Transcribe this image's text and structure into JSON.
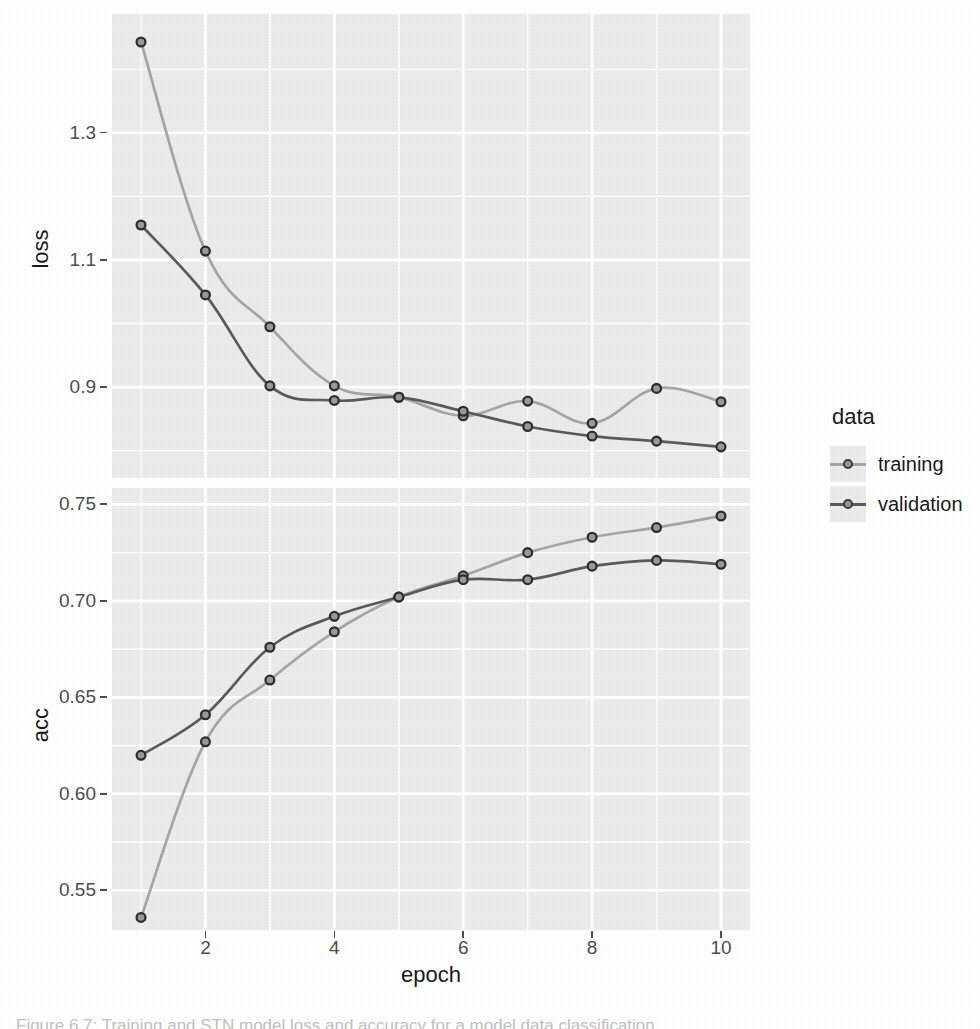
{
  "figure": {
    "caption": "Figure 6.7: Training and STN model loss and accuracy for a model data classification",
    "background_color": "#ffffff",
    "panel_background_color": "#ebebeb",
    "gridline_color": "#ffffff"
  },
  "legend": {
    "title": "data",
    "position": "right",
    "entries": [
      {
        "label": "training",
        "color": "#a5a5a5",
        "point_color": "#3a3a3a",
        "icon": "line-point-key-icon"
      },
      {
        "label": "validation",
        "color": "#5a5a5a",
        "point_color": "#3a3a3a",
        "icon": "line-point-key-icon"
      }
    ]
  },
  "axes": {
    "x": {
      "title": "epoch",
      "ticks": [
        "2",
        "4",
        "6",
        "8",
        "10"
      ],
      "tick_values": [
        2,
        4,
        6,
        8,
        10
      ],
      "range": [
        0.55,
        10.45
      ]
    },
    "y_loss": {
      "title": "loss",
      "ticks": [
        "0.9",
        "1.1",
        "1.3"
      ],
      "tick_values": [
        0.9,
        1.1,
        1.3
      ],
      "range": [
        0.757,
        1.487
      ]
    },
    "y_acc": {
      "title": "acc",
      "ticks": [
        "0.55",
        "0.60",
        "0.65",
        "0.70",
        "0.75"
      ],
      "tick_values": [
        0.55,
        0.6,
        0.65,
        0.7,
        0.75
      ],
      "range": [
        0.5295,
        0.7585
      ]
    }
  },
  "chart_data": [
    {
      "type": "line",
      "panel": "loss",
      "title": "",
      "xlabel": "epoch",
      "ylabel": "loss",
      "x": [
        1,
        2,
        3,
        4,
        5,
        6,
        7,
        8,
        9,
        10
      ],
      "xlim": [
        0.55,
        10.45
      ],
      "ylim": [
        0.757,
        1.487
      ],
      "grid": true,
      "legend": "right",
      "series": [
        {
          "name": "training",
          "color": "#a5a5a5",
          "values": [
            1.443,
            1.114,
            0.995,
            0.902,
            0.884,
            0.855,
            0.878,
            0.843,
            0.898,
            0.877
          ]
        },
        {
          "name": "validation",
          "color": "#5a5a5a",
          "values": [
            1.155,
            1.045,
            0.902,
            0.879,
            0.884,
            0.862,
            0.838,
            0.823,
            0.815,
            0.806
          ]
        }
      ],
      "smooth_lines": [
        {
          "name": "training",
          "comment": "loess through training points"
        },
        {
          "name": "validation",
          "comment": "loess through validation points"
        }
      ]
    },
    {
      "type": "line",
      "panel": "acc",
      "title": "",
      "xlabel": "epoch",
      "ylabel": "acc",
      "x": [
        1,
        2,
        3,
        4,
        5,
        6,
        7,
        8,
        9,
        10
      ],
      "xlim": [
        0.55,
        10.45
      ],
      "ylim": [
        0.5295,
        0.7585
      ],
      "grid": true,
      "legend": "right",
      "series": [
        {
          "name": "training",
          "color": "#a5a5a5",
          "values": [
            0.536,
            0.627,
            0.659,
            0.684,
            0.702,
            0.713,
            0.725,
            0.733,
            0.738,
            0.744
          ]
        },
        {
          "name": "validation",
          "color": "#5a5a5a",
          "values": [
            0.62,
            0.641,
            0.676,
            0.692,
            0.702,
            0.711,
            0.711,
            0.718,
            0.721,
            0.719
          ]
        }
      ]
    }
  ]
}
